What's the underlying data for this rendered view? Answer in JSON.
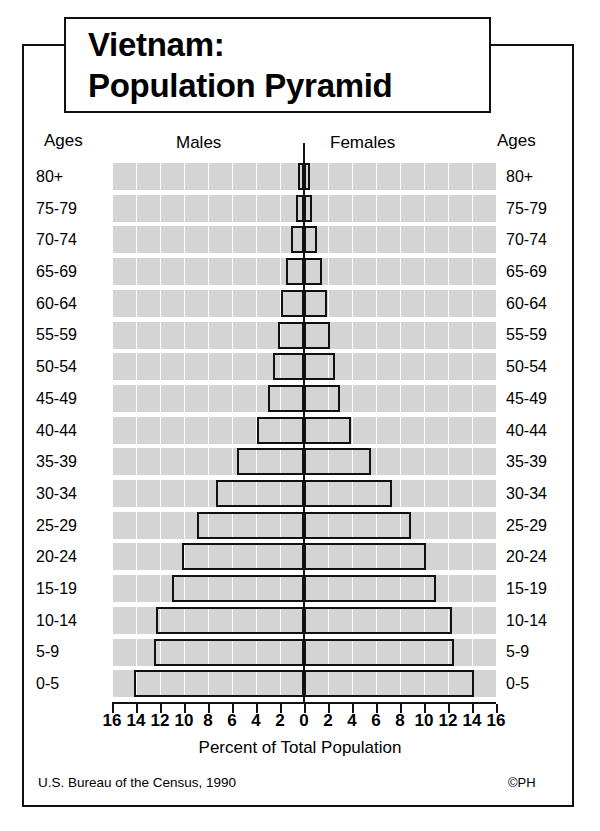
{
  "title": {
    "line1": "Vietnam:",
    "line2": "Population Pyramid"
  },
  "header": {
    "ages_left": "Ages",
    "males": "Males",
    "females": "Females",
    "ages_right": "Ages"
  },
  "footer": {
    "source": "U.S. Bureau of the Census, 1990",
    "copyright": "©PH"
  },
  "axis": {
    "title": "Percent of Total Population",
    "ticks": [
      "16",
      "14",
      "12",
      "10",
      "8",
      "6",
      "4",
      "2",
      "0",
      "2",
      "4",
      "6",
      "8",
      "10",
      "12",
      "14",
      "16"
    ],
    "max": 16,
    "step": 2
  },
  "chart_data": {
    "type": "bar",
    "subtype": "population-pyramid",
    "title": "Vietnam: Population Pyramid",
    "xlabel": "Percent of Total Population",
    "ylabel": "Ages",
    "xlim": [
      -16,
      16
    ],
    "grid": true,
    "legend": [
      "Males",
      "Females"
    ],
    "legend_position": "top",
    "note": "Values are percent of total population; male values plotted left of centre, female values right.",
    "categories": [
      "80+",
      "75-79",
      "70-74",
      "65-69",
      "60-64",
      "55-59",
      "50-54",
      "45-49",
      "40-44",
      "35-39",
      "30-34",
      "25-29",
      "20-24",
      "15-19",
      "10-14",
      "5-9",
      "0-5"
    ],
    "series": [
      {
        "name": "Males",
        "values": [
          0.5,
          0.7,
          1.1,
          1.5,
          1.9,
          2.2,
          2.6,
          3.0,
          3.9,
          5.6,
          7.3,
          8.9,
          10.2,
          11.0,
          12.3,
          12.5,
          14.2
        ]
      },
      {
        "name": "Females",
        "values": [
          0.5,
          0.7,
          1.1,
          1.5,
          1.9,
          2.2,
          2.6,
          3.0,
          3.9,
          5.6,
          7.3,
          8.9,
          10.2,
          11.0,
          12.3,
          12.5,
          14.2
        ]
      }
    ],
    "colors": {
      "bar_fill": "#d4d4d4",
      "bar_stroke": "#111111",
      "plot_band": "#d4d4d4",
      "background": "#ffffff"
    }
  }
}
